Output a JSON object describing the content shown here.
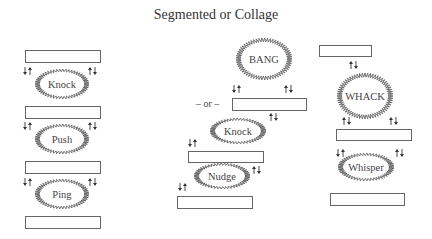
{
  "title": "Segmented or Collage",
  "separator": "– or –",
  "columns": [
    {
      "name": "segmented",
      "boxes": [
        {
          "x": 25,
          "y": 50,
          "w": 75,
          "h": 12
        },
        {
          "x": 25,
          "y": 106,
          "w": 75,
          "h": 12
        },
        {
          "x": 25,
          "y": 161,
          "w": 75,
          "h": 12
        },
        {
          "x": 25,
          "y": 216,
          "w": 75,
          "h": 12
        }
      ],
      "bursts": [
        {
          "label": "Knock",
          "cx": 62,
          "cy": 84,
          "rx": 27,
          "ry": 15
        },
        {
          "label": "Push",
          "cx": 62,
          "cy": 139,
          "rx": 27,
          "ry": 15
        },
        {
          "label": "Ping",
          "cx": 62,
          "cy": 194,
          "rx": 27,
          "ry": 15
        }
      ]
    },
    {
      "name": "collage-a",
      "boxes": [
        {
          "x": 232,
          "y": 98,
          "w": 74,
          "h": 12
        },
        {
          "x": 188,
          "y": 151,
          "w": 75,
          "h": 11
        },
        {
          "x": 177,
          "y": 196,
          "w": 75,
          "h": 12
        }
      ],
      "bursts": [
        {
          "label": "BANG",
          "cx": 264,
          "cy": 59,
          "rx": 28,
          "ry": 21
        },
        {
          "label": "Knock",
          "cx": 238,
          "cy": 131,
          "rx": 28,
          "ry": 13
        },
        {
          "label": "Nudge",
          "cx": 222,
          "cy": 176,
          "rx": 28,
          "ry": 13
        }
      ]
    },
    {
      "name": "collage-b",
      "boxes": [
        {
          "x": 319,
          "y": 45,
          "w": 52,
          "h": 11
        },
        {
          "x": 336,
          "y": 129,
          "w": 75,
          "h": 11
        },
        {
          "x": 330,
          "y": 193,
          "w": 74,
          "h": 12
        }
      ],
      "bursts": [
        {
          "label": "WHACK",
          "cx": 365,
          "cy": 96,
          "rx": 28,
          "ry": 23
        },
        {
          "label": "Whisper",
          "cx": 366,
          "cy": 167,
          "rx": 28,
          "ry": 14
        }
      ]
    }
  ],
  "arrows": [
    {
      "x": 25,
      "y": 67,
      "kind": "down-up"
    },
    {
      "x": 90,
      "y": 67,
      "kind": "up-down"
    },
    {
      "x": 25,
      "y": 122,
      "kind": "down-up"
    },
    {
      "x": 90,
      "y": 122,
      "kind": "up-down"
    },
    {
      "x": 25,
      "y": 178,
      "kind": "down-up"
    },
    {
      "x": 90,
      "y": 178,
      "kind": "up-down"
    },
    {
      "x": 234,
      "y": 85,
      "kind": "down-up"
    },
    {
      "x": 286,
      "y": 85,
      "kind": "up-down"
    },
    {
      "x": 271,
      "y": 113,
      "kind": "up-down"
    },
    {
      "x": 190,
      "y": 139,
      "kind": "down-up"
    },
    {
      "x": 254,
      "y": 166,
      "kind": "up-down"
    },
    {
      "x": 180,
      "y": 183,
      "kind": "down-up"
    },
    {
      "x": 351,
      "y": 61,
      "kind": "up-down"
    },
    {
      "x": 344,
      "y": 117,
      "kind": "up-down"
    },
    {
      "x": 391,
      "y": 117,
      "kind": "up-down"
    },
    {
      "x": 338,
      "y": 149,
      "kind": "down-up"
    },
    {
      "x": 397,
      "y": 149,
      "kind": "up-down"
    }
  ],
  "separator_pos": {
    "x": 196,
    "y": 107
  },
  "colors": {
    "line": "#555555",
    "box_stroke": "#666666",
    "text": "#333333"
  }
}
